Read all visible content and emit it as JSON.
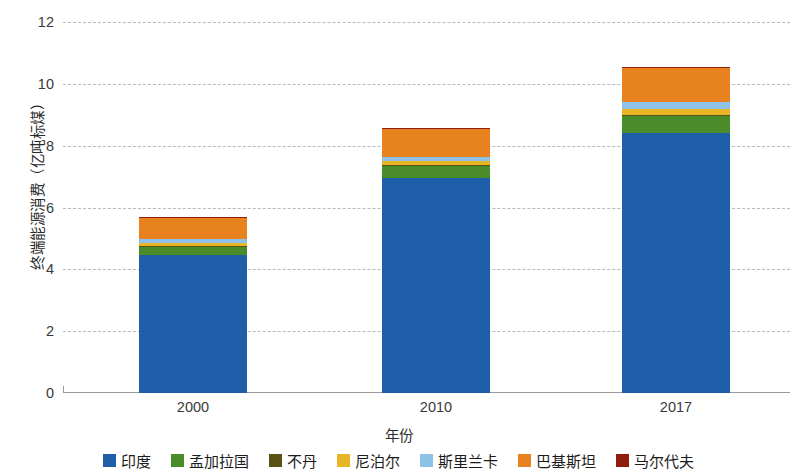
{
  "chart_data": {
    "type": "bar",
    "stacked": true,
    "title": "",
    "xlabel": "年份",
    "ylabel": "终端能源消费（亿吨标煤）",
    "categories": [
      "2000",
      "2010",
      "2017"
    ],
    "ylim": [
      0,
      12
    ],
    "yticks": [
      "0",
      "2",
      "4",
      "6",
      "8",
      "10",
      "12"
    ],
    "grid": true,
    "legend_position": "bottom",
    "series": [
      {
        "name": "印度",
        "color": "#1f5fa9",
        "values": [
          4.47,
          6.96,
          8.4
        ]
      },
      {
        "name": "孟加拉国",
        "color": "#4a8c2a",
        "values": [
          0.25,
          0.4,
          0.55
        ]
      },
      {
        "name": "不丹",
        "color": "#5b5112",
        "values": [
          0.02,
          0.02,
          0.03
        ]
      },
      {
        "name": "尼泊尔",
        "color": "#e8b526",
        "values": [
          0.1,
          0.12,
          0.2
        ]
      },
      {
        "name": "斯里兰卡",
        "color": "#8fc2e8",
        "values": [
          0.13,
          0.14,
          0.22
        ]
      },
      {
        "name": "巴基斯坦",
        "color": "#e8821e",
        "values": [
          0.72,
          0.92,
          1.14
        ]
      },
      {
        "name": "马尔代夫",
        "color": "#8f1d10",
        "values": [
          0.01,
          0.01,
          0.01
        ]
      }
    ],
    "totals": [
      5.7,
      8.57,
      10.55
    ]
  },
  "axis": {
    "ylabel": "终端能源消费（亿吨标煤）",
    "xlabel": "年份"
  },
  "legend": {
    "items": [
      {
        "label": "印度"
      },
      {
        "label": "孟加拉国"
      },
      {
        "label": "不丹"
      },
      {
        "label": "尼泊尔"
      },
      {
        "label": "斯里兰卡"
      },
      {
        "label": "巴基斯坦"
      },
      {
        "label": "马尔代夫"
      }
    ]
  }
}
